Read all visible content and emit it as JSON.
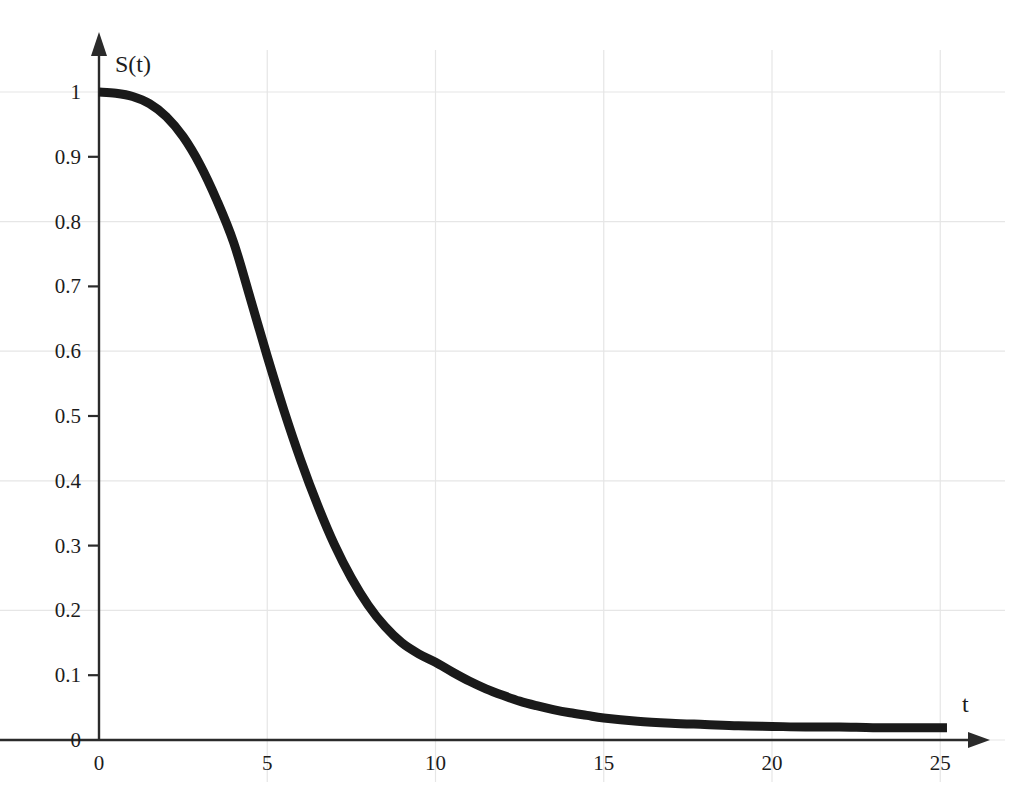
{
  "chart_data": {
    "type": "line",
    "title": "",
    "subtitle": "",
    "xlabel": "t",
    "ylabel": "S(t)",
    "xlim": [
      0,
      25.2
    ],
    "ylim": [
      0,
      1.03
    ],
    "grid": true,
    "grid_color": "#e6e6e6",
    "legend": "none",
    "background_color": "#ffffff",
    "axis_color": "#2b2b2b",
    "xticks": [
      0,
      5,
      10,
      15,
      20,
      25
    ],
    "xtick_labels": [
      "0",
      "5",
      "10",
      "15",
      "20",
      "25"
    ],
    "x_gridlines": [
      5,
      10,
      15,
      20,
      25
    ],
    "yticks": [
      0,
      0.1,
      0.2,
      0.3,
      0.4,
      0.5,
      0.6,
      0.7,
      0.8,
      0.9,
      1
    ],
    "ytick_labels": [
      "0",
      "0.1",
      "0.2",
      "0.3",
      "0.4",
      "0.5",
      "0.6",
      "0.7",
      "0.8",
      "0.9",
      "1"
    ],
    "y_gridlines": [
      0,
      0.2,
      0.4,
      0.6,
      0.8,
      1
    ],
    "y_tickmarks": [
      0.1,
      0.3,
      0.5,
      0.7,
      0.9
    ],
    "series": [
      {
        "name": "S(t)",
        "color": "#1a1a1a",
        "line_width": 9,
        "x": [
          0,
          0.5,
          1,
          1.5,
          2,
          2.5,
          3,
          3.5,
          4,
          4.5,
          5,
          5.5,
          6,
          6.5,
          7,
          7.5,
          8,
          8.5,
          9,
          9.5,
          10,
          10.5,
          11,
          11.5,
          12,
          12.5,
          13,
          13.5,
          14,
          14.5,
          15,
          16,
          17,
          18,
          19,
          20,
          21,
          22,
          23,
          24,
          25.2
        ],
        "y": [
          1.0,
          0.998,
          0.993,
          0.982,
          0.962,
          0.931,
          0.888,
          0.833,
          0.768,
          0.681,
          0.592,
          0.508,
          0.431,
          0.362,
          0.301,
          0.25,
          0.208,
          0.175,
          0.15,
          0.133,
          0.12,
          0.105,
          0.091,
          0.079,
          0.069,
          0.06,
          0.053,
          0.047,
          0.042,
          0.038,
          0.034,
          0.029,
          0.026,
          0.024,
          0.022,
          0.021,
          0.02,
          0.02,
          0.019,
          0.019,
          0.019
        ]
      }
    ],
    "annotations": [
      {
        "name": "y-axis-arrow",
        "text": ""
      },
      {
        "name": "x-axis-arrow",
        "text": ""
      }
    ]
  },
  "axis_titles": {
    "y": "S(t)",
    "x": "t"
  }
}
